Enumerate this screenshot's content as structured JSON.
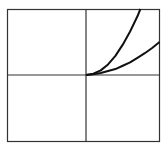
{
  "chart_data": {
    "type": "line",
    "title": "",
    "xlabel": "",
    "ylabel": "",
    "xlim": [
      -1,
      1
    ],
    "ylim": [
      -1,
      1
    ],
    "grid": false,
    "axes_through_origin": true,
    "legend": null,
    "series": [
      {
        "name": "steep curve",
        "x": [
          0,
          0.1,
          0.2,
          0.3,
          0.4,
          0.5,
          0.6,
          0.7,
          0.74
        ],
        "y": [
          0,
          0.02,
          0.07,
          0.16,
          0.29,
          0.46,
          0.66,
          0.89,
          1.0
        ]
      },
      {
        "name": "shallow curve",
        "x": [
          0,
          0.1,
          0.2,
          0.3,
          0.4,
          0.5,
          0.6,
          0.7,
          0.8,
          0.9,
          1.0
        ],
        "y": [
          0,
          0.01,
          0.03,
          0.06,
          0.09,
          0.14,
          0.19,
          0.26,
          0.33,
          0.41,
          0.5
        ]
      }
    ]
  },
  "style": {
    "line_color": "#111111",
    "frame_color": "#333333",
    "background": "#ffffff"
  }
}
